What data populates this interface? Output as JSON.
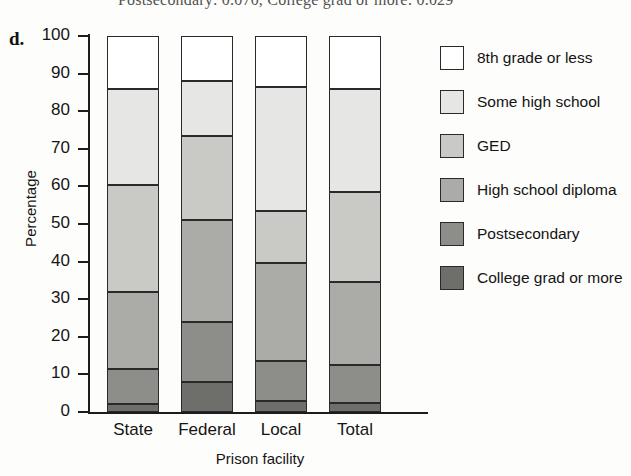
{
  "top_caption": "Postsecondary: 0.070, College grad or more: 0.029",
  "panel_label": "d.",
  "axis": {
    "ylabel": "Percentage",
    "xlabel": "Prison facility",
    "yticks": [
      "0",
      "10",
      "20",
      "30",
      "40",
      "50",
      "60",
      "70",
      "80",
      "90",
      "100"
    ]
  },
  "legend": {
    "items": [
      {
        "label": "8th grade or less",
        "color": "#ffffff"
      },
      {
        "label": "Some high school",
        "color": "#e6e6e4"
      },
      {
        "label": "GED",
        "color": "#c9c9c6"
      },
      {
        "label": "High school diploma",
        "color": "#ababa7"
      },
      {
        "label": "Postsecondary",
        "color": "#8d8d89"
      },
      {
        "label": "College grad or more",
        "color": "#6e6e6a"
      }
    ]
  },
  "chart_data": {
    "type": "bar",
    "subtype": "stacked-100-percent",
    "title": "",
    "xlabel": "Prison facility",
    "ylabel": "Percentage",
    "ylim": [
      0,
      100
    ],
    "yticks": [
      0,
      10,
      20,
      30,
      40,
      50,
      60,
      70,
      80,
      90,
      100
    ],
    "grid": false,
    "legend_position": "right",
    "categories": [
      "State",
      "Federal",
      "Local",
      "Total"
    ],
    "series": [
      {
        "name": "College grad or more",
        "color": "#6e6e6a",
        "values": [
          2.0,
          8.0,
          3.0,
          2.5
        ]
      },
      {
        "name": "Postsecondary",
        "color": "#8d8d89",
        "values": [
          9.5,
          16.0,
          10.5,
          10.0
        ]
      },
      {
        "name": "High school diploma",
        "color": "#ababa7",
        "values": [
          20.5,
          27.0,
          26.0,
          22.0
        ]
      },
      {
        "name": "GED",
        "color": "#c9c9c6",
        "values": [
          28.5,
          22.5,
          14.0,
          24.0
        ]
      },
      {
        "name": "Some high school",
        "color": "#e6e6e4",
        "values": [
          25.5,
          14.5,
          33.0,
          27.5
        ]
      },
      {
        "name": "8th grade or less",
        "color": "#ffffff",
        "values": [
          14.0,
          12.0,
          13.5,
          14.0
        ]
      }
    ],
    "cumulative_tops": {
      "State": [
        2.0,
        11.5,
        32.0,
        60.5,
        86.0,
        100
      ],
      "Federal": [
        8.0,
        24.0,
        51.0,
        73.5,
        88.0,
        100
      ],
      "Local": [
        3.0,
        13.5,
        39.5,
        53.5,
        86.5,
        100
      ],
      "Total": [
        2.5,
        12.5,
        34.5,
        58.5,
        86.0,
        100
      ]
    }
  }
}
